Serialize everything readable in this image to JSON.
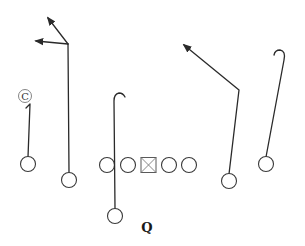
{
  "diagram": {
    "type": "football-play",
    "labels": {
      "quarterback": "Q",
      "coverage_marker": "C"
    },
    "players": [
      {
        "id": "left-wideout",
        "role": "receiver",
        "route": "short-hook-up"
      },
      {
        "id": "left-slot",
        "role": "receiver",
        "route": "double-arrow-post-corner"
      },
      {
        "id": "left-tackle",
        "role": "lineman"
      },
      {
        "id": "left-guard",
        "role": "lineman"
      },
      {
        "id": "center",
        "role": "center"
      },
      {
        "id": "right-guard",
        "role": "lineman"
      },
      {
        "id": "right-tackle",
        "role": "lineman"
      },
      {
        "id": "running-back",
        "role": "back",
        "route": "vertical-hook"
      },
      {
        "id": "right-slot",
        "role": "receiver",
        "route": "post"
      },
      {
        "id": "right-wideout",
        "role": "receiver",
        "route": "vertical-hook"
      }
    ],
    "colors": {
      "line": "#2a2a2a",
      "background": "#ffffff"
    }
  }
}
